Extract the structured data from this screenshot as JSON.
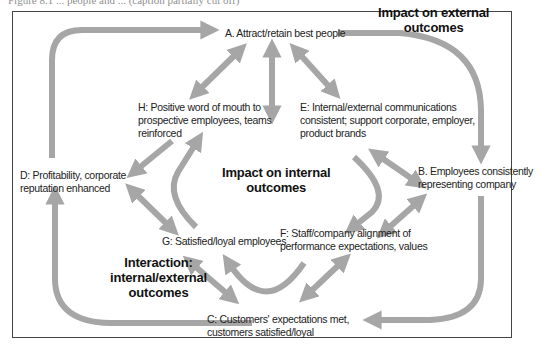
{
  "caption": "Figure 8.1 ... people and ... (caption partially cut off)",
  "colors": {
    "arrow": "#a6a6a6",
    "frame": "#444444",
    "text": "#222222",
    "heading": "#111111",
    "background": "#ffffff"
  },
  "headings": {
    "external": [
      "Impact on external",
      "outcomes"
    ],
    "internal": [
      "Impact on internal",
      "outcomes"
    ],
    "interaction": [
      "Interaction:",
      "internal/external",
      "outcomes"
    ]
  },
  "nodes": {
    "A": {
      "lines": [
        "A. Attract/retain best people"
      ]
    },
    "B": {
      "lines": [
        "B. Employees consistently",
        "representing company"
      ]
    },
    "C": {
      "lines": [
        "C: Customers' expectations met,",
        "customers satisfied/loyal"
      ]
    },
    "D": {
      "lines": [
        "D: Profitability, corporate",
        "reputation enhanced"
      ]
    },
    "E": {
      "lines": [
        "E: Internal/external communications",
        "consistent; support corporate, employer,",
        "product brands"
      ]
    },
    "F": {
      "lines": [
        "F: Staff/company alignment of",
        "performance expectations, values"
      ]
    },
    "G": {
      "lines": [
        "G: Satisfied/loyal employees"
      ]
    },
    "H": {
      "lines": [
        "H: Positive word of mouth to",
        "prospective employees, teams",
        "reinforced"
      ]
    }
  },
  "edges": [
    {
      "from": "D",
      "to": "A",
      "type": "curved-one-way"
    },
    {
      "from": "A",
      "to": "B",
      "type": "curved-one-way"
    },
    {
      "from": "B",
      "to": "C",
      "type": "curved-one-way"
    },
    {
      "from": "C",
      "to": "D",
      "type": "curved-one-way"
    },
    {
      "from": "A",
      "to": "H",
      "type": "two-way"
    },
    {
      "from": "A",
      "to": "E",
      "type": "two-way"
    },
    {
      "from": "A",
      "to": "center",
      "type": "two-way"
    },
    {
      "from": "E",
      "to": "B",
      "type": "two-way"
    },
    {
      "from": "E",
      "to": "F",
      "type": "curved-one-way"
    },
    {
      "from": "B",
      "to": "F",
      "type": "two-way"
    },
    {
      "from": "H",
      "to": "D",
      "type": "one-way"
    },
    {
      "from": "D",
      "to": "G",
      "type": "two-way"
    },
    {
      "from": "G",
      "to": "H",
      "type": "curved-one-way"
    },
    {
      "from": "G",
      "to": "C",
      "type": "two-way"
    },
    {
      "from": "F",
      "to": "G",
      "type": "curved-one-way"
    },
    {
      "from": "F",
      "to": "C",
      "type": "two-way"
    }
  ]
}
